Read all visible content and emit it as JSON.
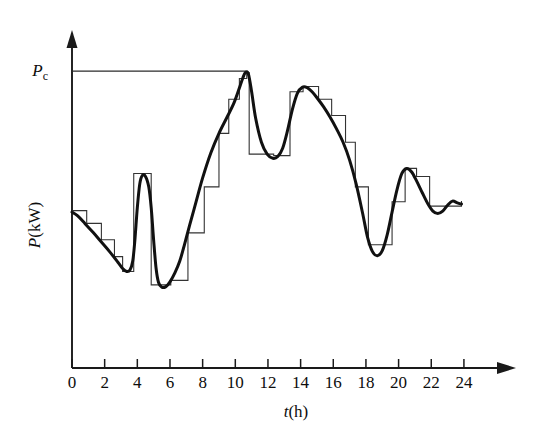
{
  "figure": {
    "background": "#ffffff",
    "line_color": "#111111",
    "step_color": "#333333",
    "axis_color": "#1a1a1a"
  },
  "axes": {
    "x": {
      "label_var": "t",
      "label_unit": "(h)",
      "ticks": [
        0,
        2,
        4,
        6,
        8,
        10,
        12,
        14,
        16,
        18,
        20,
        22,
        24
      ],
      "tick_labels": [
        "0",
        "2",
        "4",
        "6",
        "8",
        "10",
        "12",
        "14",
        "16",
        "18",
        "20",
        "22",
        "24"
      ],
      "min": 0,
      "max": 26.8,
      "has_arrow": true
    },
    "y": {
      "label": "P(kW)",
      "label_var": "P",
      "label_unit": "(kW)",
      "min": 0,
      "max": 1.18,
      "has_arrow": true,
      "tick_labels": [],
      "marker_label_var": "P",
      "marker_label_sub": "c",
      "marker_value": 1.0
    }
  },
  "annotations": [
    {
      "name": "pc-reference-line",
      "text_var": "P",
      "text_sub": "c",
      "y_value": 1.0,
      "x_start": 0,
      "x_end": 10.65,
      "style": "thin-horizontal"
    }
  ],
  "chart_data": {
    "type": "line",
    "title": "",
    "xlabel": "t(h)",
    "ylabel": "P(kW)",
    "xlim": [
      0,
      26.8
    ],
    "ylim": [
      0,
      1.18
    ],
    "grid": false,
    "legend": null,
    "series": [
      {
        "name": "continuous-load",
        "style": "smooth-thick",
        "x": [
          0.0,
          0.35,
          0.8,
          1.3,
          1.8,
          2.3,
          2.8,
          3.1,
          3.35,
          3.55,
          3.72,
          3.85,
          4.0,
          4.15,
          4.3,
          4.5,
          4.7,
          4.85,
          5.0,
          5.15,
          5.3,
          5.5,
          5.75,
          6.0,
          6.3,
          6.6,
          6.9,
          7.2,
          7.6,
          8.0,
          8.5,
          9.0,
          9.5,
          9.9,
          10.2,
          10.45,
          10.62,
          10.8,
          11.0,
          11.25,
          11.6,
          11.95,
          12.3,
          12.6,
          12.9,
          13.2,
          13.5,
          13.8,
          14.1,
          14.4,
          14.7,
          15.0,
          15.4,
          15.8,
          16.2,
          16.6,
          17.0,
          17.4,
          17.8,
          18.1,
          18.4,
          18.7,
          19.0,
          19.3,
          19.6,
          19.9,
          20.2,
          20.5,
          20.8,
          21.1,
          21.45,
          21.8,
          22.1,
          22.4,
          22.7,
          23.0,
          23.3,
          23.6,
          23.85
        ],
        "y": [
          0.525,
          0.512,
          0.486,
          0.456,
          0.424,
          0.392,
          0.357,
          0.335,
          0.325,
          0.33,
          0.36,
          0.43,
          0.54,
          0.62,
          0.648,
          0.645,
          0.61,
          0.54,
          0.43,
          0.335,
          0.288,
          0.272,
          0.274,
          0.29,
          0.32,
          0.36,
          0.418,
          0.48,
          0.56,
          0.64,
          0.724,
          0.79,
          0.845,
          0.89,
          0.935,
          0.975,
          0.995,
          0.99,
          0.93,
          0.84,
          0.76,
          0.72,
          0.706,
          0.712,
          0.74,
          0.8,
          0.872,
          0.925,
          0.945,
          0.944,
          0.93,
          0.91,
          0.88,
          0.845,
          0.805,
          0.76,
          0.7,
          0.62,
          0.52,
          0.44,
          0.392,
          0.378,
          0.395,
          0.448,
          0.525,
          0.6,
          0.655,
          0.672,
          0.66,
          0.63,
          0.59,
          0.552,
          0.528,
          0.52,
          0.528,
          0.548,
          0.562,
          0.556,
          0.552
        ]
      },
      {
        "name": "sampled-staircase",
        "style": "thin-step",
        "x_edges": [
          0.0,
          0.9,
          1.8,
          2.6,
          3.1,
          3.7,
          3.78,
          4.65,
          4.85,
          5.35,
          6.05,
          6.95,
          7.1,
          8.1,
          9.0,
          9.6,
          10.25,
          10.7,
          10.85,
          11.6,
          12.35,
          13.35,
          14.15,
          15.1,
          15.9,
          16.75,
          17.35,
          18.15,
          18.9,
          19.6,
          20.4,
          21.1,
          21.9,
          22.9,
          23.85
        ],
        "y_steps": [
          0.53,
          0.487,
          0.432,
          0.375,
          0.325,
          0.325,
          0.655,
          0.655,
          0.28,
          0.28,
          0.295,
          0.295,
          0.455,
          0.61,
          0.79,
          0.905,
          0.975,
          0.995,
          0.72,
          0.72,
          0.715,
          0.93,
          0.948,
          0.905,
          0.85,
          0.76,
          0.61,
          0.415,
          0.415,
          0.56,
          0.672,
          0.645,
          0.545,
          0.545,
          0.562
        ]
      }
    ]
  }
}
